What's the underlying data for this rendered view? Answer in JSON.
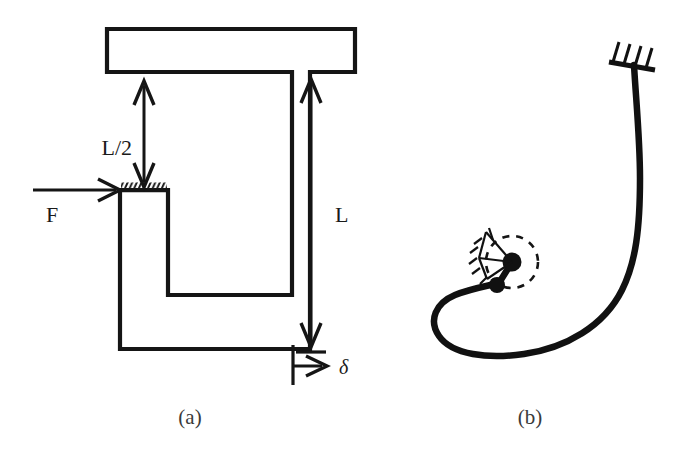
{
  "figure": {
    "background_color": "#ffffff",
    "ink_color": "#151515",
    "panels": [
      {
        "id": "a",
        "caption": "(a)",
        "description": "Undeformed C-shaped (clamped-clamped) column with applied force",
        "labels": {
          "force": "F",
          "half_length": "L/2",
          "length": "L",
          "deflection": "δ"
        },
        "annotations": [
          {
            "name": "force-arrow",
            "label": "F",
            "direction": "right"
          },
          {
            "name": "half-length-dimension",
            "label": "L/2",
            "direction": "vertical-double"
          },
          {
            "name": "length-dimension",
            "label": "L",
            "direction": "vertical-double"
          },
          {
            "name": "deflection-arrow",
            "label": "δ",
            "direction": "right"
          }
        ]
      },
      {
        "id": "b",
        "caption": "(b)",
        "description": "Buckled / post-deformed shape of the same column",
        "supports": [
          {
            "name": "fixed-clamp-support",
            "position": "top-right",
            "hatch_count": 4
          },
          {
            "name": "pin-joint-upper",
            "position": "center-left"
          },
          {
            "name": "pin-joint-lower",
            "position": "center-left"
          },
          {
            "name": "rotation-indicator-circle",
            "style": "dashed"
          }
        ]
      }
    ]
  }
}
